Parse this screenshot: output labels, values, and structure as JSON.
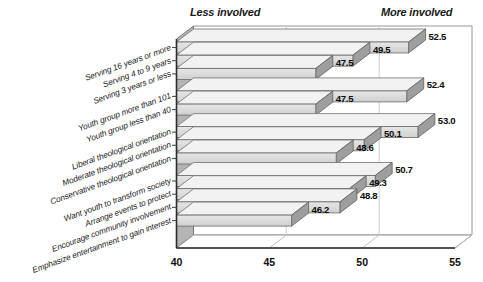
{
  "chart_data": {
    "type": "bar",
    "orientation": "horizontal",
    "title": "",
    "subtitle": "",
    "xlabel": "",
    "ylabel": "",
    "xlim": [
      40,
      55
    ],
    "xticks": [
      "40",
      "45",
      "50",
      "55"
    ],
    "grid": true,
    "legend": false,
    "style": "3d-grayscale",
    "annotations": [
      {
        "text": "Less involved",
        "position": "top-left"
      },
      {
        "text": "More involved",
        "position": "top-right"
      }
    ],
    "categories": [
      "Serving 16 years or more",
      "Serving 4 to 9 years",
      "Serving 3 years or less",
      "Youth group more than 101",
      "Youth group less than 40",
      "Liberal theological orientation",
      "Moderate theological orientation",
      "Conservative theological orientation",
      "Want youth to transform society",
      "Arrange events to protect",
      "Encourage community involvement",
      "Emphasize entertainment to gain interest"
    ],
    "values": [
      52.5,
      49.5,
      47.5,
      52.4,
      47.5,
      53.0,
      50.1,
      48.6,
      50.7,
      49.3,
      48.8,
      46.2
    ],
    "value_labels": [
      "52.5",
      "49.5",
      "47.5",
      "52.4",
      "47.5",
      "53.0",
      "50.1",
      "48.6",
      "50.7",
      "49.3",
      "48.8",
      "46.2"
    ],
    "groups": [
      {
        "name": "years-serving",
        "indices": [
          0,
          1,
          2
        ]
      },
      {
        "name": "youth-group-size",
        "indices": [
          3,
          4
        ]
      },
      {
        "name": "theological-orientation",
        "indices": [
          5,
          6,
          7
        ]
      },
      {
        "name": "ministry-goals",
        "indices": [
          8,
          9,
          10,
          11
        ]
      }
    ],
    "colors": {
      "bar_face": "#d9d9d9",
      "bar_top": "#efefef",
      "bar_side": "#9a9a9a",
      "axis": "#2b2b2b",
      "grid": "#c8c8c8",
      "text": "#111111",
      "background": "#ffffff"
    }
  }
}
